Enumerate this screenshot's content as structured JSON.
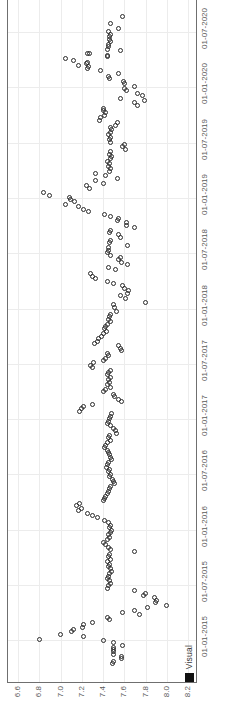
{
  "chart": {
    "type_label": "scatter",
    "legend": {
      "label": "Visual",
      "marker": "filled-square",
      "color": "#111111"
    },
    "grid": "on",
    "marker_style": "open-circle",
    "marker_color": "#2b2b2b",
    "frame_color": "#6f6f6f",
    "grid_color": "#ececec",
    "orientation": "rotated-90"
  },
  "value_axis": {
    "ticks": [
      "6.6",
      "6.8",
      "7.0",
      "7.2",
      "7.4",
      "7.6",
      "7.8",
      "8.0",
      "8.2"
    ],
    "min": 6.6,
    "max": 8.2
  },
  "date_axis": {
    "ticks": [
      "01-07-2020",
      "01-01-2020",
      "01-07-2019",
      "01-01-2019",
      "01-07-2018",
      "01-01-2018",
      "01-07-2017",
      "01-01-2017",
      "01-07-2016",
      "01-01-2016",
      "01-07-2015",
      "01-01-2015"
    ]
  },
  "chart_data": {
    "type": "scatter",
    "title": "",
    "xlabel": "",
    "ylabel": "",
    "xlim": [
      6.6,
      8.2
    ],
    "grid": true,
    "legend": [
      "Visual"
    ],
    "legend_position": "bottom-right",
    "series": [
      {
        "name": "Visual",
        "marker": "open-circle",
        "x_axis": "value",
        "y_axis": "date",
        "xlim": [
          6.6,
          8.2
        ],
        "note": "x = measured value 6.6-8.2, y = date 01-01-2015 to 01-07-2020 (axis drawn vertically, newest at top)",
        "points": [
          [
            7.58,
            "2020-08-20"
          ],
          [
            7.47,
            "2020-07-28"
          ],
          [
            7.55,
            "2020-07-14"
          ],
          [
            7.45,
            "2020-07-02"
          ],
          [
            7.47,
            "2020-06-24"
          ],
          [
            7.46,
            "2020-06-16"
          ],
          [
            7.46,
            "2020-06-08"
          ],
          [
            7.47,
            "2020-06-01"
          ],
          [
            7.45,
            "2020-05-22"
          ],
          [
            7.45,
            "2020-05-14"
          ],
          [
            7.44,
            "2020-05-05"
          ],
          [
            7.56,
            "2020-05-01"
          ],
          [
            7.25,
            "2020-04-22"
          ],
          [
            7.27,
            "2020-04-20"
          ],
          [
            7.44,
            "2020-04-16"
          ],
          [
            7.44,
            "2020-04-10"
          ],
          [
            7.05,
            "2020-04-05"
          ],
          [
            7.12,
            "2020-03-30"
          ],
          [
            7.25,
            "2020-03-24"
          ],
          [
            7.24,
            "2020-03-18"
          ],
          [
            7.17,
            "2020-03-12"
          ],
          [
            7.26,
            "2020-03-08"
          ],
          [
            7.25,
            "2020-03-02"
          ],
          [
            7.38,
            "2020-02-24"
          ],
          [
            7.55,
            "2020-02-14"
          ],
          [
            7.45,
            "2020-02-06"
          ],
          [
            7.46,
            "2020-01-30"
          ],
          [
            7.59,
            "2020-01-20"
          ],
          [
            7.6,
            "2020-01-12"
          ],
          [
            7.7,
            "2020-01-04"
          ],
          [
            7.6,
            "2019-12-28"
          ],
          [
            7.62,
            "2019-12-20"
          ],
          [
            7.72,
            "2019-12-12"
          ],
          [
            7.77,
            "2019-12-04"
          ],
          [
            7.56,
            "2019-11-26"
          ],
          [
            7.79,
            "2019-11-18"
          ],
          [
            7.7,
            "2019-11-10"
          ],
          [
            7.72,
            "2019-11-02"
          ],
          [
            7.4,
            "2019-10-24"
          ],
          [
            7.4,
            "2019-10-16"
          ],
          [
            7.42,
            "2019-10-08"
          ],
          [
            7.41,
            "2019-09-30"
          ],
          [
            7.38,
            "2019-09-22"
          ],
          [
            7.37,
            "2019-09-14"
          ],
          [
            7.54,
            "2019-09-06"
          ],
          [
            7.52,
            "2019-08-29"
          ],
          [
            7.47,
            "2019-08-21"
          ],
          [
            7.48,
            "2019-08-13"
          ],
          [
            7.47,
            "2019-08-05"
          ],
          [
            7.45,
            "2019-07-28"
          ],
          [
            7.47,
            "2019-07-20"
          ],
          [
            7.46,
            "2019-07-12"
          ],
          [
            7.47,
            "2019-07-04"
          ],
          [
            7.6,
            "2019-06-26"
          ],
          [
            7.58,
            "2019-06-18"
          ],
          [
            7.61,
            "2019-06-10"
          ],
          [
            7.47,
            "2019-06-02"
          ],
          [
            7.46,
            "2019-05-25"
          ],
          [
            7.48,
            "2019-05-17"
          ],
          [
            7.47,
            "2019-05-09"
          ],
          [
            7.44,
            "2019-05-01"
          ],
          [
            7.46,
            "2019-04-23"
          ],
          [
            7.45,
            "2019-04-15"
          ],
          [
            7.47,
            "2019-04-07"
          ],
          [
            7.46,
            "2019-03-30"
          ],
          [
            7.33,
            "2019-03-22"
          ],
          [
            7.42,
            "2019-03-14"
          ],
          [
            7.54,
            "2019-03-06"
          ],
          [
            7.33,
            "2019-02-26"
          ],
          [
            7.4,
            "2019-02-18"
          ],
          [
            7.24,
            "2019-02-10"
          ],
          [
            7.27,
            "2019-02-02"
          ],
          [
            6.84,
            "2019-01-18"
          ],
          [
            6.9,
            "2019-01-10"
          ],
          [
            7.08,
            "2019-01-02"
          ],
          [
            7.09,
            "2018-12-26"
          ],
          [
            7.13,
            "2018-12-18"
          ],
          [
            7.05,
            "2018-12-10"
          ],
          [
            7.17,
            "2018-12-02"
          ],
          [
            7.22,
            "2018-11-24"
          ],
          [
            7.26,
            "2018-11-16"
          ],
          [
            7.41,
            "2018-11-08"
          ],
          [
            7.47,
            "2018-11-00"
          ],
          [
            7.55,
            "2018-10-26"
          ],
          [
            7.54,
            "2018-10-18"
          ],
          [
            7.62,
            "2018-10-10"
          ],
          [
            7.62,
            "2018-10-02"
          ],
          [
            7.7,
            "2018-09-24"
          ],
          [
            7.47,
            "2018-09-16"
          ],
          [
            7.46,
            "2018-09-08"
          ],
          [
            7.55,
            "2018-09-00"
          ],
          [
            7.56,
            "2018-08-22"
          ],
          [
            7.47,
            "2018-08-14"
          ],
          [
            7.46,
            "2018-08-06"
          ],
          [
            7.63,
            "2018-07-28"
          ],
          [
            7.45,
            "2018-07-20"
          ],
          [
            7.45,
            "2018-07-12"
          ],
          [
            7.44,
            "2018-07-04"
          ],
          [
            7.47,
            "2018-06-26"
          ],
          [
            7.56,
            "2018-06-18"
          ],
          [
            7.55,
            "2018-06-10"
          ],
          [
            7.57,
            "2018-06-02"
          ],
          [
            7.63,
            "2018-05-25"
          ],
          [
            7.45,
            "2018-05-17"
          ],
          [
            7.52,
            "2018-05-09"
          ],
          [
            7.28,
            "2018-04-25"
          ],
          [
            7.3,
            "2018-04-17"
          ],
          [
            7.33,
            "2018-04-09"
          ],
          [
            7.44,
            "2018-04-01"
          ],
          [
            7.5,
            "2018-03-24"
          ],
          [
            7.58,
            "2018-03-16"
          ],
          [
            7.6,
            "2018-03-08"
          ],
          [
            7.64,
            "2018-02-28"
          ],
          [
            7.63,
            "2018-02-20"
          ],
          [
            7.56,
            "2018-02-12"
          ],
          [
            7.61,
            "2018-02-04"
          ],
          [
            7.8,
            "2018-01-20"
          ],
          [
            7.5,
            "2018-01-12"
          ],
          [
            7.51,
            "2018-01-04"
          ],
          [
            7.53,
            "2017-12-20"
          ],
          [
            7.47,
            "2017-12-12"
          ],
          [
            7.46,
            "2017-12-04"
          ],
          [
            7.45,
            "2017-11-26"
          ],
          [
            7.47,
            "2017-11-18"
          ],
          [
            7.44,
            "2017-11-10"
          ],
          [
            7.42,
            "2017-11-02"
          ],
          [
            7.41,
            "2017-10-25"
          ],
          [
            7.43,
            "2017-10-17"
          ],
          [
            7.4,
            "2017-10-09"
          ],
          [
            7.39,
            "2017-10-01"
          ],
          [
            7.36,
            "2017-09-23"
          ],
          [
            7.35,
            "2017-09-15"
          ],
          [
            7.32,
            "2017-09-07"
          ],
          [
            7.55,
            "2017-08-30"
          ],
          [
            7.56,
            "2017-08-22"
          ],
          [
            7.57,
            "2017-08-14"
          ],
          [
            7.44,
            "2017-08-06"
          ],
          [
            7.45,
            "2017-07-29"
          ],
          [
            7.42,
            "2017-07-21"
          ],
          [
            7.4,
            "2017-07-13"
          ],
          [
            7.31,
            "2017-07-05"
          ],
          [
            7.28,
            "2017-06-27"
          ],
          [
            7.3,
            "2017-06-19"
          ],
          [
            7.47,
            "2017-06-11"
          ],
          [
            7.45,
            "2017-06-03"
          ],
          [
            7.44,
            "2017-05-26"
          ],
          [
            7.47,
            "2017-05-18"
          ],
          [
            7.45,
            "2017-05-10"
          ],
          [
            7.46,
            "2017-05-02"
          ],
          [
            7.44,
            "2017-04-24"
          ],
          [
            7.47,
            "2017-04-16"
          ],
          [
            7.42,
            "2017-04-08"
          ],
          [
            7.4,
            "2017-03-31"
          ],
          [
            7.5,
            "2017-03-23"
          ],
          [
            7.51,
            "2017-03-15"
          ],
          [
            7.55,
            "2017-03-07"
          ],
          [
            7.57,
            "2017-02-27"
          ],
          [
            7.3,
            "2017-02-19"
          ],
          [
            7.22,
            "2017-02-11"
          ],
          [
            7.2,
            "2017-02-03"
          ],
          [
            7.18,
            "2017-01-26"
          ],
          [
            7.48,
            "2017-01-18"
          ],
          [
            7.47,
            "2017-01-10"
          ],
          [
            7.46,
            "2017-01-02"
          ],
          [
            7.45,
            "2016-12-25"
          ],
          [
            7.44,
            "2016-12-17"
          ],
          [
            7.47,
            "2016-12-09"
          ],
          [
            7.5,
            "2016-12-01"
          ],
          [
            7.52,
            "2016-11-23"
          ],
          [
            7.53,
            "2016-11-15"
          ],
          [
            7.46,
            "2016-11-07"
          ],
          [
            7.45,
            "2016-10-30"
          ],
          [
            7.47,
            "2016-10-22"
          ],
          [
            7.44,
            "2016-10-14"
          ],
          [
            7.42,
            "2016-10-06"
          ],
          [
            7.41,
            "2016-09-28"
          ],
          [
            7.44,
            "2016-09-20"
          ],
          [
            7.45,
            "2016-09-12"
          ],
          [
            7.46,
            "2016-09-04"
          ],
          [
            7.47,
            "2016-08-27"
          ],
          [
            7.48,
            "2016-08-19"
          ],
          [
            7.45,
            "2016-08-11"
          ],
          [
            7.44,
            "2016-08-03"
          ],
          [
            7.43,
            "2016-07-26"
          ],
          [
            7.46,
            "2016-07-18"
          ],
          [
            7.45,
            "2016-07-10"
          ],
          [
            7.47,
            "2016-07-02"
          ],
          [
            7.46,
            "2016-06-24"
          ],
          [
            7.49,
            "2016-06-16"
          ],
          [
            7.5,
            "2016-06-08"
          ],
          [
            7.51,
            "2016-06-00"
          ],
          [
            7.47,
            "2016-05-23"
          ],
          [
            7.46,
            "2016-05-15"
          ],
          [
            7.45,
            "2016-05-07"
          ],
          [
            7.44,
            "2016-04-29"
          ],
          [
            7.42,
            "2016-04-21"
          ],
          [
            7.41,
            "2016-04-13"
          ],
          [
            7.4,
            "2016-04-05"
          ],
          [
            7.18,
            "2016-03-28"
          ],
          [
            7.15,
            "2016-03-20"
          ],
          [
            7.2,
            "2016-03-12"
          ],
          [
            7.17,
            "2016-03-04"
          ],
          [
            7.25,
            "2016-02-25"
          ],
          [
            7.3,
            "2016-02-17"
          ],
          [
            7.35,
            "2016-02-09"
          ],
          [
            7.41,
            "2016-02-01"
          ],
          [
            7.45,
            "2016-01-24"
          ],
          [
            7.47,
            "2016-01-16"
          ],
          [
            7.46,
            "2016-01-08"
          ],
          [
            7.48,
            "2015-12-31"
          ],
          [
            7.47,
            "2015-12-23"
          ],
          [
            7.45,
            "2015-12-15"
          ],
          [
            7.46,
            "2015-12-07"
          ],
          [
            7.44,
            "2015-11-29"
          ],
          [
            7.4,
            "2015-11-21"
          ],
          [
            7.42,
            "2015-11-13"
          ],
          [
            7.45,
            "2015-11-05"
          ],
          [
            7.47,
            "2015-10-28"
          ],
          [
            7.7,
            "2015-10-20"
          ],
          [
            7.46,
            "2015-10-12"
          ],
          [
            7.45,
            "2015-10-04"
          ],
          [
            7.47,
            "2015-09-26"
          ],
          [
            7.44,
            "2015-09-18"
          ],
          [
            7.46,
            "2015-09-10"
          ],
          [
            7.45,
            "2015-09-02"
          ],
          [
            7.47,
            "2015-08-25"
          ],
          [
            7.48,
            "2015-08-17"
          ],
          [
            7.46,
            "2015-08-09"
          ],
          [
            7.45,
            "2015-08-01"
          ],
          [
            7.44,
            "2015-07-24"
          ],
          [
            7.46,
            "2015-07-16"
          ],
          [
            7.47,
            "2015-07-08"
          ],
          [
            7.45,
            "2015-06-30"
          ],
          [
            7.44,
            "2015-06-22"
          ],
          [
            7.7,
            "2015-06-14"
          ],
          [
            7.8,
            "2015-06-06"
          ],
          [
            7.78,
            "2015-05-29"
          ],
          [
            7.88,
            "2015-05-21"
          ],
          [
            7.9,
            "2015-05-13"
          ],
          [
            7.89,
            "2015-05-05"
          ],
          [
            8.0,
            "2015-04-27"
          ],
          [
            7.82,
            "2015-04-19"
          ],
          [
            7.7,
            "2015-04-11"
          ],
          [
            7.58,
            "2015-04-03"
          ],
          [
            7.74,
            "2015-03-26"
          ],
          [
            7.44,
            "2015-03-18"
          ],
          [
            7.46,
            "2015-03-10"
          ],
          [
            7.3,
            "2015-03-02"
          ],
          [
            7.22,
            "2015-02-22"
          ],
          [
            7.21,
            "2015-02-14"
          ],
          [
            7.12,
            "2015-02-06"
          ],
          [
            7.1,
            "2015-01-29"
          ],
          [
            7.0,
            "2015-01-21"
          ],
          [
            7.22,
            "2015-01-13"
          ],
          [
            6.8,
            "2015-01-05"
          ],
          [
            7.4,
            "2015-01-00"
          ],
          [
            7.5,
            "2014-12-24"
          ],
          [
            7.58,
            "2014-12-16"
          ],
          [
            7.5,
            "2014-12-08"
          ],
          [
            7.5,
            "2014-12-00"
          ],
          [
            7.5,
            "2014-11-24"
          ],
          [
            7.5,
            "2014-11-16"
          ],
          [
            7.57,
            "2014-11-08"
          ],
          [
            7.57,
            "2014-11-00"
          ],
          [
            7.5,
            "2014-10-24"
          ],
          [
            7.49,
            "2014-10-16"
          ]
        ]
      }
    ]
  }
}
